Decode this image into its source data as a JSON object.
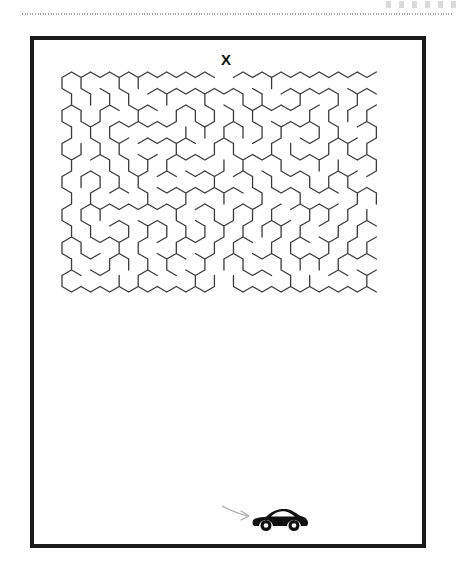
{
  "page": {
    "width": 470,
    "height": 575,
    "background_color": "#ffffff",
    "ink_color": "#1a1a1a",
    "wall_color": "#3b3b3b",
    "arrow_color": "#9a9a9a"
  },
  "header": {
    "rule_style": "dotted",
    "rule_color": "#9a9a9a"
  },
  "puzzle": {
    "title": "",
    "frame": {
      "x": 30,
      "y": 36,
      "width": 396,
      "height": 512,
      "border_width": 4
    },
    "type": "hexagonal-maze",
    "entrance_label": "X",
    "exit_icon": "sports-car-icon",
    "arrow_icon": "arrow-right-icon"
  },
  "maze": {
    "x": 62,
    "y": 72,
    "width": 316,
    "height": 430,
    "cols": 17,
    "rows": 13,
    "hex_radius": 11,
    "seed": 20240517,
    "entrance_col": 8,
    "exit_col": 8,
    "wall_width": 1.3,
    "wall_color": "#3b3b3b"
  },
  "chart_data": {
    "type": "table",
    "categories": [
      "entrance",
      "exit"
    ],
    "values": [
      1,
      1
    ]
  }
}
